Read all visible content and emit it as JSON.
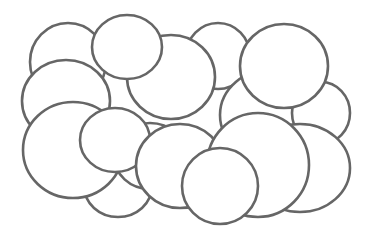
{
  "diagram": {
    "type": "overlapping-ellipses",
    "background": "#ffffff",
    "stroke_color": "#666666",
    "fill_color": "#ffffff",
    "stroke_width": 2.6,
    "ellipses": [
      {
        "cx": 68,
        "cy": 62,
        "rx": 38,
        "ry": 39
      },
      {
        "cx": 218,
        "cy": 56,
        "rx": 32,
        "ry": 33
      },
      {
        "cx": 66,
        "cy": 101,
        "rx": 44,
        "ry": 41
      },
      {
        "cx": 275,
        "cy": 115,
        "rx": 55,
        "ry": 47
      },
      {
        "cx": 321,
        "cy": 113,
        "rx": 29,
        "ry": 31
      },
      {
        "cx": 300,
        "cy": 168,
        "rx": 50,
        "ry": 44
      },
      {
        "cx": 118,
        "cy": 186,
        "rx": 34,
        "ry": 31
      },
      {
        "cx": 150,
        "cy": 156,
        "rx": 36,
        "ry": 33
      },
      {
        "cx": 73,
        "cy": 150,
        "rx": 50,
        "ry": 48
      },
      {
        "cx": 171,
        "cy": 77,
        "rx": 44,
        "ry": 42
      },
      {
        "cx": 127,
        "cy": 47,
        "rx": 35,
        "ry": 32
      },
      {
        "cx": 284,
        "cy": 66,
        "rx": 44,
        "ry": 42
      },
      {
        "cx": 115,
        "cy": 140,
        "rx": 35,
        "ry": 32
      },
      {
        "cx": 180,
        "cy": 166,
        "rx": 44,
        "ry": 42
      },
      {
        "cx": 258,
        "cy": 165,
        "rx": 51,
        "ry": 52
      },
      {
        "cx": 220,
        "cy": 186,
        "rx": 38,
        "ry": 38
      }
    ]
  }
}
